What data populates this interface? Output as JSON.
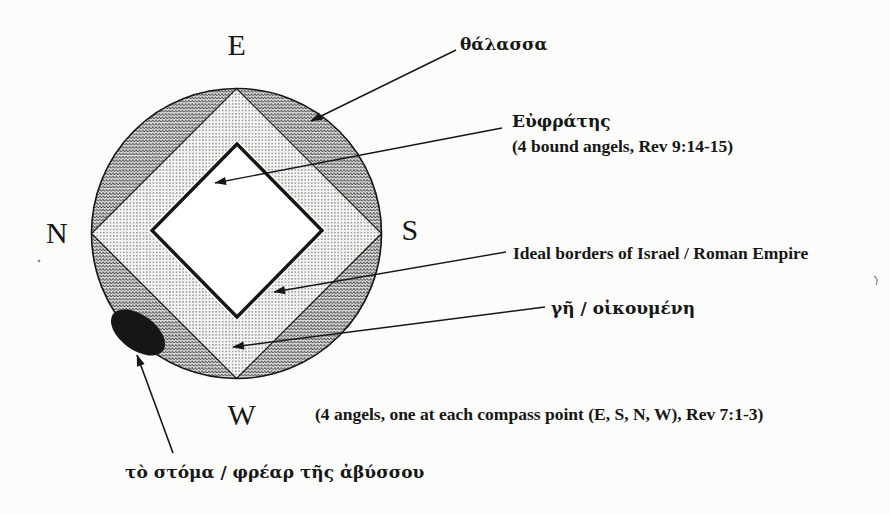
{
  "compass": {
    "east": "E",
    "south": "S",
    "north": "N",
    "west": "W"
  },
  "callouts": {
    "sea": "θάλασσα",
    "euphrates": "Εὐφράτης",
    "euphrates_note": "(4 bound angels, Rev 9:14-15)",
    "israel_borders": "Ideal borders of Israel / Roman Empire",
    "earth": "γῆ / οἰκουμένη",
    "compass_angels_note": "(4 angels, one at each compass point (E, S, N, W), Rev 7:1-3)",
    "abyss": "τὸ στόμα / φρέαρ τῆς ἀβύσσου"
  },
  "colors": {
    "ink": "#161616",
    "sea_bg": "#dcdcda",
    "sea_wave": "#2e2e2e",
    "earth_bg": "#f6f5f2",
    "earth_dot": "#2a2a2a",
    "diamond_fill": "#ffffff",
    "paper": "#fcfcfa"
  }
}
